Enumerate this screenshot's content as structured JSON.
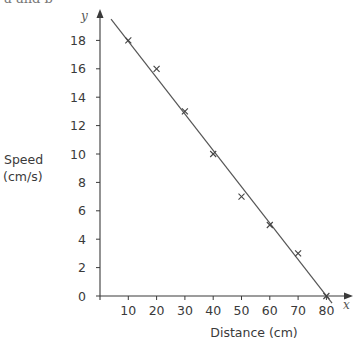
{
  "page": {
    "top_fragment": "a and b"
  },
  "colors": {
    "axis": "#3a3a3a",
    "line": "#555555",
    "marker": "#444444",
    "text": "#3a3a3a"
  },
  "chart_data": {
    "type": "scatter",
    "title": "",
    "xlabel": "Distance (cm)",
    "ylabel": "Speed (cm/s)",
    "ylabel_lines": [
      "Speed",
      "(cm/s)"
    ],
    "x_axis_var": "x",
    "y_axis_var": "y",
    "xlim": [
      0,
      80
    ],
    "ylim": [
      0,
      19
    ],
    "grid": false,
    "legend": null,
    "x_ticks": [
      10,
      20,
      30,
      40,
      50,
      60,
      70,
      80
    ],
    "y_ticks": [
      0,
      2,
      4,
      6,
      8,
      10,
      12,
      14,
      16,
      18
    ],
    "marker": "x",
    "series": [
      {
        "name": "measurements",
        "x": [
          10,
          20,
          30,
          40,
          50,
          60,
          70,
          80
        ],
        "y": [
          18,
          16,
          13,
          10,
          7,
          5,
          3,
          0
        ]
      }
    ],
    "line_of_best_fit": {
      "start": [
        3.9,
        19.5
      ],
      "end": [
        82,
        -0.5
      ]
    }
  }
}
